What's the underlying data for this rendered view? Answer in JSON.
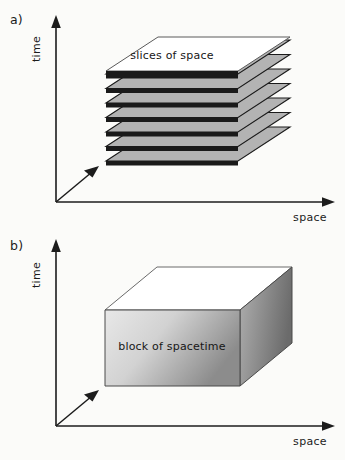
{
  "figure": {
    "background_color": "#fbfbf9",
    "ink_color": "#1c1c1c"
  },
  "panels": [
    {
      "id": "a",
      "label": "a)",
      "axes": {
        "vertical_label": "time",
        "horizontal_label": "space",
        "depth_axis": "diagonal-arrow"
      },
      "object": {
        "kind": "stack-of-slices",
        "caption": "slices of space",
        "slice_count": 8,
        "top_slice_fill": "#ffffff",
        "slice_fill": "#b3b3b3",
        "slice_edge_fill": "#1a1a1a"
      }
    },
    {
      "id": "b",
      "label": "b)",
      "axes": {
        "vertical_label": "time",
        "horizontal_label": "space",
        "depth_axis": "diagonal-arrow"
      },
      "object": {
        "kind": "solid-block",
        "caption": "block of spacetime",
        "top_face_fill": "#ffffff",
        "front_face_fill_light": "#e2e2e2",
        "front_face_fill_dark": "#8f8f8f",
        "side_face_fill_light": "#a8a8a8",
        "side_face_fill_dark": "#6e6e6e"
      }
    }
  ]
}
